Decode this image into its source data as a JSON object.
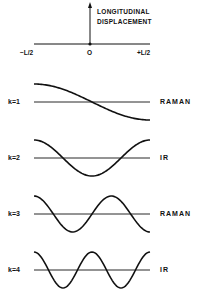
{
  "axis": {
    "title_line1": "LONGITUDINAL",
    "title_line2": "DISPLACEMENT",
    "left_label": "−L/2",
    "center_label": "O",
    "right_label": "+L/2"
  },
  "modes": [
    {
      "k_label": "k=1",
      "activity": "RAMAN",
      "k": 1
    },
    {
      "k_label": "k=2",
      "activity": "IR",
      "k": 2
    },
    {
      "k_label": "k=3",
      "activity": "RAMAN",
      "k": 3
    },
    {
      "k_label": "k=4",
      "activity": "IR",
      "k": 4
    }
  ],
  "colors": {
    "ink": "#111111",
    "background": "#ffffff"
  }
}
